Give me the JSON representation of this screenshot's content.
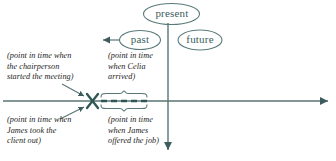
{
  "diagram": {
    "colors": {
      "line": "#3d5d5d",
      "bubble_stroke": "#5a7a7a",
      "bubble_text": "#3d5d5d",
      "annotation_text": "#1b1b1b",
      "background": "#ffffff"
    },
    "bubbles": [
      {
        "id": "present",
        "label": "present"
      },
      {
        "id": "past",
        "label": "past"
      },
      {
        "id": "future",
        "label": "future"
      }
    ],
    "axes": {
      "horizontal": {
        "name": "time-axis",
        "arrow": "right"
      },
      "vertical": {
        "name": "present-axis",
        "arrow": "down"
      },
      "past_pointer": {
        "name": "past-arrow",
        "arrow": "left"
      }
    },
    "markers": {
      "x_mark": {
        "label": "X"
      },
      "dashed_span": {
        "label": "dashed-duration-segment"
      }
    },
    "annotations": [
      {
        "id": "chairperson",
        "text": "(point in time when\nthe chairperson\nstarted the meeting)"
      },
      {
        "id": "celia",
        "text": "(point in time\nwhen Celia\narrived)"
      },
      {
        "id": "james-out",
        "text": "(point in time when\nJames took the\nclient out)"
      },
      {
        "id": "james-job",
        "text": "(point in time\nwhen James\noffered the job)"
      }
    ]
  }
}
